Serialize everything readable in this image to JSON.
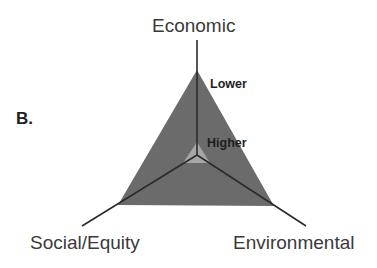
{
  "panel_label": "B.",
  "axes": {
    "top": "Economic",
    "bottom_left": "Social/Equity",
    "bottom_right": "Environmental"
  },
  "levels": {
    "outer": "Lower",
    "inner": "Higher"
  },
  "colors": {
    "outer_triangle": "#6b6b6b",
    "inner_triangle": "#a6a6a6",
    "axis_lines": "#2b2b2b",
    "text": "#3a3a3a"
  }
}
